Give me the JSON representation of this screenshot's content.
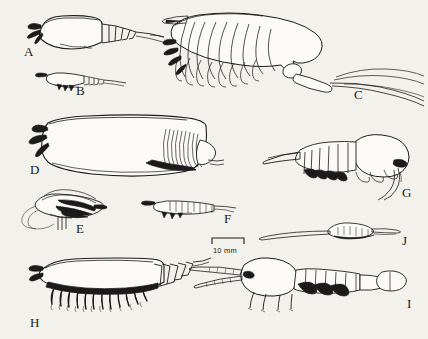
{
  "figure": {
    "type": "scientific-plate",
    "background_color": "#f3f1ec",
    "ink_color": "#1b1b1b",
    "panel_count": 10
  },
  "scale_bar": {
    "label": "10 mm",
    "x": 212,
    "y": 238,
    "bar_width": 32
  },
  "panels": [
    {
      "id": "A",
      "label": "A",
      "label_x": 24,
      "label_y": 45,
      "description": "shrimp-like form with carapace and segmented abdomen"
    },
    {
      "id": "B",
      "label": "B",
      "label_x": 76,
      "label_y": 84,
      "description": "small elongate larval form"
    },
    {
      "id": "C",
      "label": "C",
      "label_x": 354,
      "label_y": 88,
      "description": "large specimen with pinnate appendages and long caudal rami"
    },
    {
      "id": "D",
      "label": "D",
      "label_x": 30,
      "label_y": 163,
      "description": "large bivalved carapace with hatched posterior"
    },
    {
      "id": "E",
      "label": "E",
      "label_x": 76,
      "label_y": 222,
      "description": "dark head with mouthparts and long filaments"
    },
    {
      "id": "F",
      "label": "F",
      "label_x": 224,
      "label_y": 212,
      "description": "small slender segmented specimen"
    },
    {
      "id": "G",
      "label": "G",
      "label_x": 402,
      "label_y": 186,
      "description": "tapering segmented abdomen with carapace and limbs"
    },
    {
      "id": "H",
      "label": "H",
      "label_x": 30,
      "label_y": 316,
      "description": "elongate body with dense ventral legs"
    },
    {
      "id": "I",
      "label": "I",
      "label_x": 407,
      "label_y": 297,
      "description": "specimen with long antennae, oval carapace and telson"
    },
    {
      "id": "J",
      "label": "J",
      "label_x": 402,
      "label_y": 234,
      "description": "small flattened form with long setae"
    }
  ]
}
